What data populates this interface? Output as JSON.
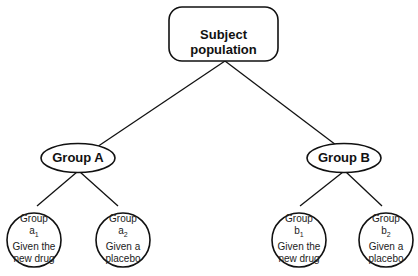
{
  "diagram": {
    "root": {
      "label": "Subject population"
    },
    "groups": [
      {
        "label": "Group A",
        "subgroups": [
          {
            "line1": "Group",
            "letter": "a",
            "sub": "1",
            "line3": "Given the",
            "line4": "new drug"
          },
          {
            "line1": "Group",
            "letter": "a",
            "sub": "2",
            "line3": "Given a",
            "line4": "placebo"
          }
        ]
      },
      {
        "label": "Group B",
        "subgroups": [
          {
            "line1": "Group",
            "letter": "b",
            "sub": "1",
            "line3": "Given the",
            "line4": "new drug"
          },
          {
            "line1": "Group",
            "letter": "b",
            "sub": "2",
            "line3": "Given a",
            "line4": "placebo"
          }
        ]
      }
    ]
  }
}
